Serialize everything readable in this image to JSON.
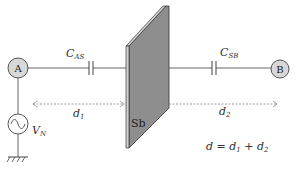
{
  "diagram": {
    "nodes": {
      "a": {
        "label": "A"
      },
      "b": {
        "label": "B"
      },
      "source": {
        "label_main": "V",
        "label_sub": "N"
      },
      "plate": {
        "label": "Sb"
      }
    },
    "capacitors": {
      "as": {
        "main": "C",
        "sub": "AS"
      },
      "sb": {
        "main": "C",
        "sub": "SB"
      }
    },
    "distances": {
      "d1": {
        "main": "d",
        "sub": "1"
      },
      "d2": {
        "main": "d",
        "sub": "2"
      }
    },
    "equation": {
      "lhs": "d",
      "eq": " = ",
      "t1_main": "d",
      "t1_sub": "1",
      "plus": " + ",
      "t2_main": "d",
      "t2_sub": "2"
    },
    "colors": {
      "wire": "#555555",
      "node_fill": "#d8d8d8",
      "plate_face": "#8e8e8e",
      "plate_edge": "#cfcfcf",
      "arrow": "#888888"
    }
  }
}
